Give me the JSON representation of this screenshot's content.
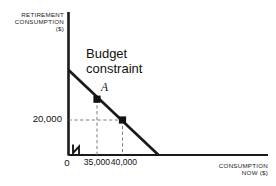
{
  "figure": {
    "background_color": "#ffffff",
    "ink_color": "#1a1a1a",
    "width": 276,
    "height": 186
  },
  "axes": {
    "y_axis_title": "RETIREMENT\nCONSUMPTION\n($)",
    "x_axis_title": "CONSUMPTION\nNOW ($)",
    "origin_label": "0",
    "y_ticks": [
      {
        "label": "20,000",
        "value": 20000
      }
    ],
    "x_ticks": [
      {
        "label": "35,000",
        "value": 35000
      },
      {
        "label": "40,000",
        "value": 40000
      }
    ],
    "axis_break": "zigzag-break-on-x-axis"
  },
  "annotations": {
    "budget_constraint_line_1": "Budget",
    "budget_constraint_line_2": "constraint",
    "point_a_label": "A"
  },
  "chart_data": {
    "type": "line",
    "title": "",
    "subtitle": "",
    "xlabel": "CONSUMPTION NOW ($)",
    "ylabel": "RETIREMENT CONSUMPTION ($)",
    "grid": false,
    "legend": "none",
    "xlim": [
      0,
      60000
    ],
    "ylim": [
      0,
      44000
    ],
    "series": [
      {
        "name": "Budget constraint",
        "type": "line",
        "x": [
          0,
          50000
        ],
        "y": [
          44000,
          0
        ],
        "style": "solid",
        "color": "#1a1a1a",
        "width": 2.6
      }
    ],
    "points": [
      {
        "name": "A",
        "label": "A",
        "x": 35000,
        "y": 28000,
        "marker": "square",
        "color": "#111111"
      },
      {
        "name": "B",
        "label": "",
        "x": 40000,
        "y": 20000,
        "marker": "square",
        "color": "#111111"
      }
    ],
    "guide_lines": [
      {
        "name": "vertical-at-35000",
        "orientation": "vertical",
        "at": 35000,
        "from": 0,
        "to": 28000,
        "style": "dashed"
      },
      {
        "name": "vertical-at-40000",
        "orientation": "vertical",
        "at": 40000,
        "from": 0,
        "to": 20000,
        "style": "dashed"
      },
      {
        "name": "horizontal-at-20000",
        "orientation": "horizontal",
        "at": 20000,
        "from": 0,
        "to": 40000,
        "style": "dashed"
      }
    ],
    "annotations": [
      {
        "text": "Budget constraint",
        "x": 14000,
        "y": 40000
      },
      {
        "text": "A",
        "x": 36500,
        "y": 31000
      }
    ]
  }
}
